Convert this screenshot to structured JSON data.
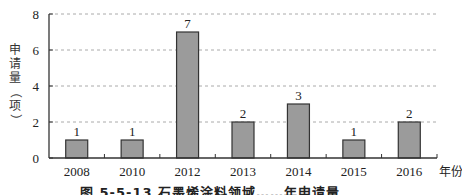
{
  "chart_data": {
    "type": "bar",
    "title": "",
    "caption": "图 5-5-13 石墨烯涂料领域……年申请量",
    "categories": [
      "2008",
      "2010",
      "2012",
      "2013",
      "2014",
      "2015",
      "2016"
    ],
    "values": [
      1,
      1,
      7,
      2,
      3,
      1,
      2
    ],
    "data_labels": [
      "1",
      "1",
      "7",
      "2",
      "3",
      "1",
      "2"
    ],
    "xlabel": "年份",
    "ylabel": "申请量（项）",
    "ylabel_chars": [
      "申",
      "请",
      "量",
      "（",
      "项",
      "）"
    ],
    "ylim": [
      0,
      8
    ],
    "yticks": [
      "0",
      "2",
      "4",
      "6",
      "8"
    ],
    "grid": true,
    "grid_style": "dashed",
    "legend": null,
    "colors": {
      "bar_fill": "#9b9b9b",
      "bar_stroke": "#333333",
      "axis": "#333333",
      "grid": "#aaaaaa"
    }
  }
}
